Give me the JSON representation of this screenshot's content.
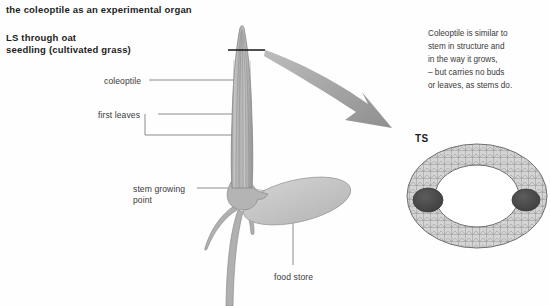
{
  "document": {
    "heading_main": "the coleoptile as an experimental organ",
    "heading_sub_line1": "LS through oat",
    "heading_sub_line2": "seedling (cultivated grass)"
  },
  "labels": {
    "coleoptile": "coleoptile",
    "first_leaves": "first leaves",
    "stem_growing_point_line1": "stem growing",
    "stem_growing_point_line2": "point",
    "food_store": "food store",
    "ts": "TS"
  },
  "annotation": {
    "line1": "Coleoptile is similar to",
    "line2": "stem in structure and",
    "line3": "in the way it grows,",
    "line4": "– but carries no buds",
    "line5": "or leaves, as stems do."
  },
  "colors": {
    "background": "#fefefe",
    "text": "#2a2a2a",
    "heading_text": "#1d1d1d",
    "leader_line": "#6e6e6e",
    "plant_fill": "#b3b3b3",
    "plant_stroke": "#8a8a8a",
    "food_store_fill": "#c8c8c8",
    "arrow_fill": "#a8a8a8",
    "section_line": "#141414",
    "ts_ring_fill": "#d2d2d2",
    "ts_core_fill": "#ffffff",
    "ts_bundle_fill": "#4a4a4a"
  },
  "diagram": {
    "type": "botanical-longitudinal-section",
    "views": [
      "LS",
      "TS"
    ]
  }
}
